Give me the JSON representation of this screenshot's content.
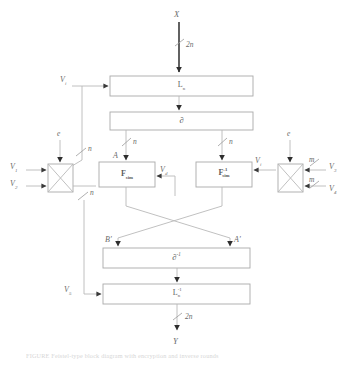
{
  "figure": {
    "type": "block-diagram",
    "title_caption": "FIGURE      Feistel-type block diagram with encryption and inverse rounds",
    "colors": {
      "line": "#b9b9b9",
      "line_dark": "#3a3a3a",
      "text": "#6a6a6a",
      "box_stroke": "#a9a9a9",
      "background": "#ffffff"
    }
  },
  "io": {
    "input_label": "X",
    "input_width": "2n",
    "output_label": "Y",
    "output_width": "2n"
  },
  "blocks": [
    {
      "id": "L-top",
      "label_base": "L",
      "label_sub": "n",
      "label_sup": ""
    },
    {
      "id": "partial",
      "label_base": "∂",
      "label_sub": "",
      "label_sup": ""
    },
    {
      "id": "F-forward",
      "label_base": "F",
      "label_sub": "sim",
      "label_sup": ""
    },
    {
      "id": "F-inverse",
      "label_base": "F",
      "label_sub": "sim",
      "label_sup": "-1"
    },
    {
      "id": "partial-inv",
      "label_base": "∂",
      "label_sub": "",
      "label_sup": "-1"
    },
    {
      "id": "L-bottom",
      "label_base": "L",
      "label_sub": "n",
      "label_sup": "-1"
    }
  ],
  "xor_gates": [
    {
      "id": "xor-left",
      "key_label": "e"
    },
    {
      "id": "xor-right",
      "key_label": "e"
    }
  ],
  "signals": {
    "v1": "V",
    "v1_sub": "1",
    "v2": "V",
    "v2_sub": "2",
    "v3": "V",
    "v3_sub": "3",
    "v4": "V",
    "v4_sub": "4",
    "v5": "V",
    "v5_sub": "5",
    "vi_top": "V",
    "vi_top_sub": "i",
    "vd": "V",
    "vd_sub": "d",
    "vi_right": "V",
    "vi_right_sub": "i"
  },
  "bit_widths": {
    "top_in": "2n",
    "left_branch": "n",
    "branch_a": "n",
    "branch_b": "n",
    "xor_left_upper": "n",
    "xor_left_lower": "n",
    "xor_right_upper": "m",
    "xor_right_lower": "m",
    "bottom_out": "2n"
  },
  "node_labels": {
    "a": "A",
    "b_prime": "B'",
    "a_prime": "A'"
  }
}
